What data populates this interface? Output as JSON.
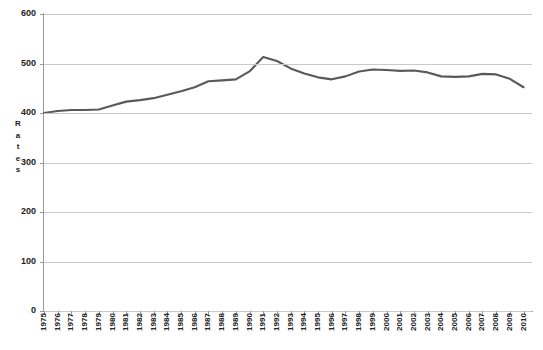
{
  "chart_data": {
    "type": "line",
    "title": "",
    "xlabel": "",
    "ylabel": "Rates",
    "ylim": [
      0,
      600
    ],
    "ytick_values": [
      0,
      100,
      200,
      300,
      400,
      500,
      600
    ],
    "grid": true,
    "legend": "none",
    "line_color": "#595959",
    "categories": [
      "1975",
      "1976",
      "1977",
      "1978",
      "1979",
      "1980",
      "1981",
      "1982",
      "1983",
      "1984",
      "1985",
      "1986",
      "1987",
      "1988",
      "1989",
      "1990",
      "1991",
      "1992",
      "1993",
      "1994",
      "1995",
      "1996",
      "1997",
      "1998",
      "1999",
      "2000",
      "2001",
      "2002",
      "2003",
      "2004",
      "2005",
      "2006",
      "2007",
      "2008",
      "2009",
      "2010"
    ],
    "series": [
      {
        "name": "Rates",
        "values": [
          400,
          404,
          406,
          406,
          407,
          415,
          423,
          426,
          430,
          437,
          444,
          452,
          464,
          466,
          468,
          484,
          513,
          505,
          490,
          480,
          472,
          468,
          474,
          484,
          488,
          487,
          485,
          486,
          482,
          474,
          473,
          474,
          479,
          478,
          469,
          452
        ]
      }
    ]
  },
  "yaxis": {
    "title_letters": [
      "R",
      "a",
      "t",
      "e",
      "s"
    ]
  }
}
